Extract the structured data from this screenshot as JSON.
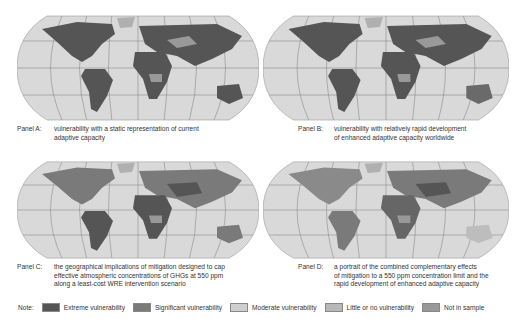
{
  "top_text": "...vulnerability...",
  "panels": [
    {
      "id": "A",
      "label": "Panel A:",
      "lines": [
        "vulnerability with a static representation of current",
        "adaptive capacity"
      ]
    },
    {
      "id": "B",
      "label": "Panel B:",
      "lines": [
        "vulnerability with relatively rapid development",
        "of enhanced adaptive capacity worldwide"
      ]
    },
    {
      "id": "C",
      "label": "Panel C:",
      "lines": [
        "the geographical implications of mitigation designed to cap",
        "effective atmospheric concentrations of GHGs at 550 ppm",
        "along a least-cost WRE intervention scenario"
      ]
    },
    {
      "id": "D",
      "label": "Panel D:",
      "lines": [
        "a portrait of the combined complementary effects",
        "of mitigation to a 550 ppm concentration limit and the",
        "rapid development of enhanced adaptive capacity"
      ]
    }
  ],
  "legend": {
    "note": "Note:",
    "items": [
      {
        "label": "Extreme vulnerability",
        "color": "#555555"
      },
      {
        "label": "Significant vulnerability",
        "color": "#7a7a7a"
      },
      {
        "label": "Moderate vulnerability",
        "color": "#cfcfcf"
      },
      {
        "label": "Little or no vulnerability",
        "color": "#b8b8b8"
      },
      {
        "label": "Not in sample",
        "color": "#999999"
      }
    ]
  },
  "colors": {
    "ocean": "#d9d9d9",
    "grid": "#8a8a8a",
    "extreme": "#555555",
    "significant": "#7a7a7a",
    "moderate": "#bdbdbd",
    "little": "#a6a6a6",
    "notsample": "#999999"
  }
}
